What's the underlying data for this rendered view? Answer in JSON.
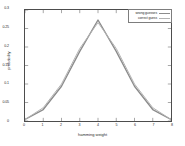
{
  "chart_data": {
    "type": "line",
    "title": "",
    "xlabel": "hamming weight",
    "ylabel": "probability",
    "xlim": [
      0,
      8
    ],
    "ylim": [
      0,
      0.3
    ],
    "grid": false,
    "legend_position": "upper right",
    "xticks": [
      "0",
      "1",
      "2",
      "3",
      "4",
      "5",
      "6",
      "7",
      "8"
    ],
    "yticks": [
      "0",
      "0.05",
      "0.1",
      "0.15",
      "0.2",
      "0.25",
      "0.3"
    ],
    "x": [
      0,
      1,
      2,
      3,
      4,
      5,
      6,
      7,
      8
    ],
    "series": [
      {
        "name": "wrong guesses",
        "color": "#8c8c8c",
        "values": [
          0.004,
          0.031,
          0.094,
          0.188,
          0.273,
          0.188,
          0.094,
          0.031,
          0.004
        ]
      },
      {
        "name": "correct guess",
        "color": "#b3b3b3",
        "values": [
          0.004,
          0.036,
          0.1,
          0.196,
          0.266,
          0.196,
          0.1,
          0.036,
          0.004
        ]
      }
    ]
  },
  "legend": {
    "entries": [
      {
        "label": "wrong guesses",
        "color": "#8c8c8c"
      },
      {
        "label": "correct guess",
        "color": "#b3b3b3"
      }
    ]
  },
  "axes": {
    "xlabel": "hamming weight",
    "ylabel": "probability",
    "xticks": [
      "0",
      "1",
      "2",
      "3",
      "4",
      "5",
      "6",
      "7",
      "8"
    ],
    "yticks": [
      "0.3",
      "0.25",
      "0.2",
      "0.15",
      "0.1",
      "0.05",
      "0"
    ]
  }
}
